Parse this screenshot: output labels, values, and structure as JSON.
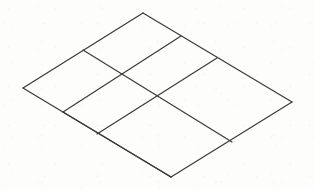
{
  "figure": {
    "shape_type": "isometric-grid",
    "rows": 3,
    "columns": 3,
    "cell_count": 9,
    "line_color": "#3a3a3a",
    "line_width": 1.2,
    "background_color": "#fdfdfc",
    "canvas": {
      "width": 314,
      "height": 189
    }
  },
  "geometry": {
    "corners": {
      "top": {
        "label": "top-apex",
        "x": 143,
        "y": 13
      },
      "left": {
        "label": "left-vertex",
        "x": 23,
        "y": 88
      },
      "right": {
        "label": "right-vertex",
        "x": 292,
        "y": 102
      },
      "bottom": {
        "label": "bottom-apex",
        "x": 171,
        "y": 177
      }
    },
    "edge_divisions": {
      "top_left_edge": [
        {
          "x": 83,
          "y": 50
        }
      ],
      "top_right_edge": [
        {
          "x": 181,
          "y": 36
        },
        {
          "x": 217,
          "y": 58
        }
      ],
      "bottom_left_edge": [
        {
          "x": 63,
          "y": 112
        },
        {
          "x": 97,
          "y": 134
        }
      ],
      "bottom_right_edge": [
        {
          "x": 232,
          "y": 142
        }
      ]
    },
    "grid_lines": {
      "family_a_label": "lines parallel to top-left edge",
      "family_a": [
        {
          "name": "boundary-upper-left",
          "x1": 143,
          "y1": 13,
          "x2": 23,
          "y2": 88
        },
        {
          "name": "division-a-1",
          "x1": 181,
          "y1": 36,
          "x2": 63,
          "y2": 112
        },
        {
          "name": "division-a-2",
          "x1": 217,
          "y1": 58,
          "x2": 97,
          "y2": 134
        },
        {
          "name": "boundary-lower-right",
          "x1": 292,
          "y1": 102,
          "x2": 171,
          "y2": 177
        }
      ],
      "family_b_label": "lines parallel to top-right edge",
      "family_b": [
        {
          "name": "boundary-upper-right",
          "x1": 143,
          "y1": 13,
          "x2": 292,
          "y2": 102
        },
        {
          "name": "division-b-1",
          "x1": 83,
          "y1": 50,
          "x2": 232,
          "y2": 142
        },
        {
          "name": "division-b-2",
          "x1": 63,
          "y1": 112,
          "x2": 171,
          "y2": 177
        },
        {
          "name": "boundary-lower-left",
          "x1": 23,
          "y1": 88,
          "x2": 171,
          "y2": 177
        }
      ]
    },
    "interior_intersections": [
      {
        "name": "intersection-1",
        "x": 120,
        "y": 72
      },
      {
        "name": "intersection-2",
        "x": 156,
        "y": 94
      },
      {
        "name": "intersection-3",
        "x": 194,
        "y": 118
      },
      {
        "name": "intersection-4",
        "x": 133,
        "y": 156
      }
    ]
  },
  "labels": {
    "caption": ""
  }
}
